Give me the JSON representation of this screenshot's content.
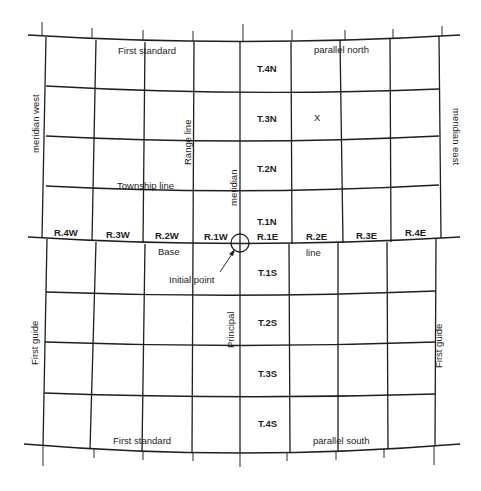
{
  "figure": {
    "colors": {
      "background": "#ffffff",
      "ink": "#1c1c1c"
    }
  },
  "labels": {
    "top_standard_left": "First standard",
    "top_standard_right": "parallel north",
    "bottom_standard_left": "First standard",
    "bottom_standard_right": "parallel south",
    "guide_meridian_west_top": "meridian west",
    "guide_meridian_east_top": "meridian east",
    "guide_meridian_west_bottom": "First guide",
    "guide_meridian_east_bottom": "First guide",
    "range_line": "Range line",
    "township_line": "Township line",
    "principal_meridian_upper": "meridian",
    "principal_meridian_lower": "Principal",
    "base_line_left": "Base",
    "base_line_right": "line",
    "initial_point": "Initial point",
    "marker": "X"
  },
  "ranges": {
    "west": [
      "R.4W",
      "R.3W",
      "R.2W",
      "R.1W"
    ],
    "east": [
      "R.1E",
      "R.2E",
      "R.3E",
      "R.4E"
    ]
  },
  "townships": {
    "north": [
      "T.4N",
      "T.3N",
      "T.2N",
      "T.1N"
    ],
    "south": [
      "T.1S",
      "T.2S",
      "T.3S",
      "T.4S"
    ]
  }
}
